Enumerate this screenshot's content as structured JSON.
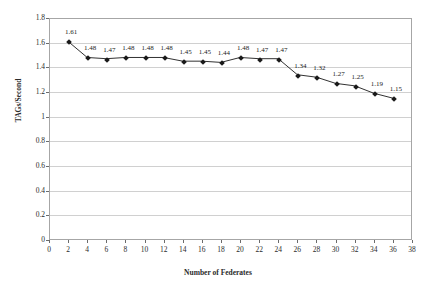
{
  "chart_data": {
    "type": "line",
    "title": "",
    "xlabel": "Number of Federates",
    "ylabel": "TAGs/Second",
    "xlim": [
      0,
      38
    ],
    "ylim": [
      0,
      1.8
    ],
    "grid": true,
    "legend": "none",
    "x": [
      2,
      4,
      6,
      8,
      10,
      12,
      14,
      16,
      18,
      20,
      22,
      24,
      26,
      28,
      30,
      32,
      34,
      36
    ],
    "values": [
      1.61,
      1.48,
      1.47,
      1.48,
      1.48,
      1.48,
      1.45,
      1.45,
      1.44,
      1.48,
      1.47,
      1.47,
      1.34,
      1.32,
      1.27,
      1.25,
      1.19,
      1.15
    ],
    "point_labels": [
      "1.61",
      "1.48",
      "1.47",
      "1.48",
      "1.48",
      "1.48",
      "1.45",
      "1.45",
      "1.44",
      "1.48",
      "1.47",
      "1.47",
      "1.34",
      "1.32",
      "1.27",
      "1.25",
      "1.19",
      "1.15"
    ],
    "xticks": [
      0,
      2,
      4,
      6,
      8,
      10,
      12,
      14,
      16,
      18,
      20,
      22,
      24,
      26,
      28,
      30,
      32,
      34,
      36,
      38
    ],
    "xtick_labels": [
      "0",
      "2",
      "4",
      "6",
      "8",
      "10",
      "12",
      "14",
      "16",
      "18",
      "20",
      "22",
      "24",
      "26",
      "28",
      "30",
      "32",
      "34",
      "36",
      "38"
    ],
    "yticks": [
      0,
      0.2,
      0.4,
      0.6,
      0.8,
      1,
      1.2,
      1.4,
      1.6,
      1.8
    ],
    "ytick_labels": [
      "0",
      "0.2",
      "0.4",
      "0.6",
      "0.8",
      "1",
      "1.2",
      "1.4",
      "1.6",
      "1.8"
    ],
    "series_color": "#1a1a1a",
    "grid_color": "#d0d0d0",
    "frame_color": "#a6a6a6"
  }
}
